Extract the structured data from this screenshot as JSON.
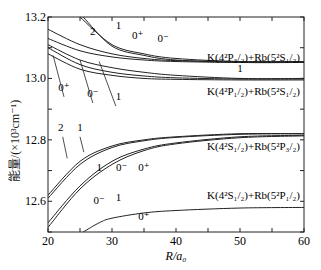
{
  "chart_data": {
    "type": "line",
    "title": "",
    "xlabel": "R/a₀",
    "ylabel": "能量/(×10³cm⁻¹)",
    "xlim": [
      20,
      60
    ],
    "ylim": [
      12.5,
      13.2
    ],
    "x_ticks": [
      "20",
      "30",
      "40",
      "50",
      "60"
    ],
    "y_ticks": [
      "12.6",
      "12.8",
      "13.0",
      "13.2"
    ],
    "grid": false,
    "legend": "none",
    "asymptote_labels": [
      {
        "text": "K(4²P₃/₂)+Rb(5²S₁/₂)",
        "y": 13.07
      },
      {
        "text": "K(4²P₁/₂)+Rb(5²S₁/₂)",
        "y": 12.96
      },
      {
        "text": "K(4²S₁/₂)+Rb(5²P₃/₂)",
        "y": 12.78
      },
      {
        "text": "K(4²S₁/₂)+Rb(5²P₁/₂)",
        "y": 12.62
      }
    ],
    "series": [
      {
        "name": "K(4P3/2)+Rb(5S1/2) Ω=1 (upper)",
        "x": [
          25,
          30,
          35,
          40,
          50,
          60
        ],
        "values": [
          13.2,
          13.11,
          13.08,
          13.065,
          13.055,
          13.055
        ]
      },
      {
        "name": "K(4P3/2)+Rb(5S1/2) Ω=0+",
        "x": [
          25.5,
          30,
          35,
          40,
          50,
          60
        ],
        "values": [
          13.2,
          13.105,
          13.075,
          13.06,
          13.052,
          13.052
        ]
      },
      {
        "name": "K(4P3/2)+Rb(5S1/2) Ω=2",
        "x": [
          20,
          25,
          30,
          35,
          40,
          50,
          60
        ],
        "values": [
          13.16,
          13.11,
          13.08,
          13.065,
          13.058,
          13.055,
          13.055
        ]
      },
      {
        "name": "K(4P3/2)+Rb(5S1/2) Ω=0-",
        "x": [
          20,
          25,
          30,
          35,
          40,
          50,
          60
        ],
        "values": [
          13.13,
          13.09,
          13.07,
          13.06,
          13.055,
          13.052,
          13.052
        ]
      },
      {
        "name": "K(4P1/2)+Rb(5S1/2) Ω=1",
        "x": [
          20,
          25,
          30,
          35,
          40,
          50,
          60
        ],
        "values": [
          13.11,
          13.06,
          13.035,
          13.02,
          13.01,
          13.0,
          13.0
        ]
      },
      {
        "name": "K(4P1/2)+Rb(5S1/2) Ω=0-",
        "x": [
          20,
          25,
          30,
          35,
          40,
          50,
          60
        ],
        "values": [
          13.1,
          13.045,
          13.02,
          13.008,
          13.002,
          12.998,
          12.998
        ]
      },
      {
        "name": "K(4P1/2)+Rb(5S1/2) Ω=0+",
        "x": [
          20,
          25,
          30,
          35,
          40,
          50,
          60
        ],
        "values": [
          13.08,
          13.03,
          13.01,
          13.0,
          12.997,
          12.995,
          12.995
        ]
      },
      {
        "name": "K(4S1/2)+Rb(5P3/2) Ω=2",
        "x": [
          20,
          25,
          30,
          35,
          40,
          50,
          60
        ],
        "values": [
          12.62,
          12.73,
          12.78,
          12.8,
          12.81,
          12.82,
          12.82
        ]
      },
      {
        "name": "K(4S1/2)+Rb(5P3/2) Ω=1",
        "x": [
          20,
          25,
          30,
          35,
          40,
          50,
          60
        ],
        "values": [
          12.61,
          12.72,
          12.775,
          12.797,
          12.808,
          12.818,
          12.82
        ]
      },
      {
        "name": "K(4S1/2)+Rb(5P3/2) Ω=1'",
        "x": [
          20,
          25,
          30,
          35,
          40,
          50,
          60
        ],
        "values": [
          12.53,
          12.65,
          12.73,
          12.77,
          12.79,
          12.81,
          12.815
        ]
      },
      {
        "name": "K(4S1/2)+Rb(5P3/2) Ω=0-",
        "x": [
          20,
          25,
          30,
          35,
          40,
          50,
          60
        ],
        "values": [
          12.515,
          12.64,
          12.72,
          12.765,
          12.787,
          12.807,
          12.813
        ]
      },
      {
        "name": "K(4S1/2)+Rb(5P1/2) Ω=0+",
        "x": [
          25.5,
          28,
          30,
          35,
          40,
          50,
          60
        ],
        "values": [
          12.5,
          12.53,
          12.545,
          12.562,
          12.57,
          12.578,
          12.58
        ]
      }
    ],
    "curve_labels": [
      {
        "text": "2",
        "x": 27,
        "y": 13.14
      },
      {
        "text": "1",
        "x": 31,
        "y": 13.16
      },
      {
        "text": "0⁺",
        "x": 34,
        "y": 13.13
      },
      {
        "text": "0⁻",
        "x": 38,
        "y": 13.12
      },
      {
        "text": "1",
        "x": 50,
        "y": 13.02
      },
      {
        "text": "0⁺",
        "x": 22.5,
        "y": 12.96
      },
      {
        "text": "0⁻",
        "x": 27,
        "y": 12.94
      },
      {
        "text": "1",
        "x": 31,
        "y": 12.93
      },
      {
        "text": "2",
        "x": 22,
        "y": 12.83
      },
      {
        "text": "1",
        "x": 25,
        "y": 12.83
      },
      {
        "text": "1",
        "x": 28,
        "y": 12.7
      },
      {
        "text": "0⁻",
        "x": 31.5,
        "y": 12.7
      },
      {
        "text": "0⁺",
        "x": 35,
        "y": 12.7
      },
      {
        "text": "0⁻",
        "x": 28,
        "y": 12.59
      },
      {
        "text": "1",
        "x": 31,
        "y": 12.6
      },
      {
        "text": "0⁺",
        "x": 35,
        "y": 12.54
      }
    ]
  },
  "labels": {
    "ylabel": "能量/(×10³cm⁻¹)",
    "xlabel": "R/a₀"
  }
}
